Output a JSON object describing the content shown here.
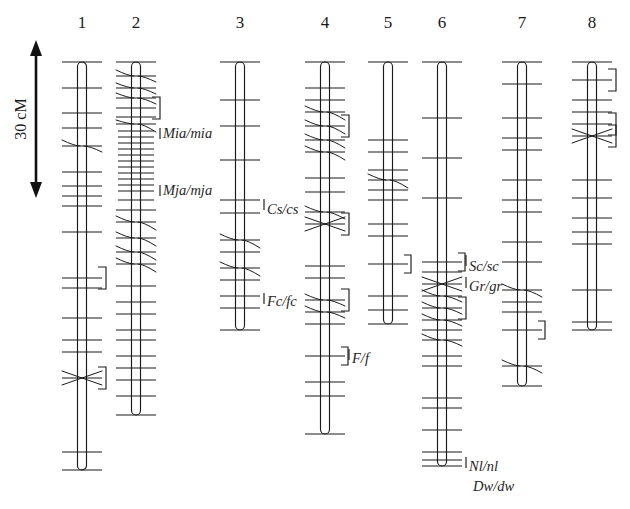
{
  "figure": {
    "width": 630,
    "height": 509,
    "background": "#ffffff",
    "line_color": "#1a1a1a"
  },
  "scale": {
    "label": "30 cM",
    "value": 30,
    "unit": "cM",
    "x": 36,
    "y_top": 42,
    "y_bottom": 196,
    "pixels_per_cM": 5.133
  },
  "chart_data": {
    "type": "linkage-map",
    "xlabel": "",
    "ylabel": "30 cM",
    "axis_unit": "cM",
    "legend_position": "none",
    "grid": false,
    "group_label_y": 28,
    "linkage_groups": [
      {
        "name": "1",
        "x": 82,
        "top": 62,
        "bottom": 470,
        "markers": [
          {
            "y": 62,
            "style": "plain"
          },
          {
            "y": 88,
            "style": "plain"
          },
          {
            "y": 113,
            "style": "plain"
          },
          {
            "y": 128,
            "style": "plain"
          },
          {
            "y": 146,
            "style": "fan",
            "fan": [
              140,
              152
            ]
          },
          {
            "y": 172,
            "style": "plain"
          },
          {
            "y": 186,
            "style": "plain"
          },
          {
            "y": 196,
            "style": "plain"
          },
          {
            "y": 206,
            "style": "plain"
          },
          {
            "y": 232,
            "style": "plain"
          },
          {
            "y": 278,
            "style": "plain",
            "bracket": true
          },
          {
            "y": 288,
            "style": "plain"
          },
          {
            "y": 318,
            "style": "plain"
          },
          {
            "y": 340,
            "style": "plain"
          },
          {
            "y": 352,
            "style": "plain"
          },
          {
            "y": 378,
            "style": "cross",
            "bracket": true
          },
          {
            "y": 452,
            "style": "plain"
          },
          {
            "y": 470,
            "style": "plain"
          }
        ]
      },
      {
        "name": "2",
        "x": 136,
        "top": 62,
        "bottom": 415,
        "markers": [
          {
            "y": 62,
            "style": "plain"
          },
          {
            "y": 76,
            "style": "fan",
            "fan": [
              70,
              82
            ]
          },
          {
            "y": 88,
            "style": "fan",
            "fan": [
              83,
              94
            ]
          },
          {
            "y": 98,
            "style": "fan",
            "fan": [
              93,
              104
            ]
          },
          {
            "y": 108,
            "style": "plain",
            "bracket": true
          },
          {
            "y": 117,
            "style": "plain"
          },
          {
            "y": 124,
            "style": "fan",
            "fan": [
              120,
              132
            ]
          },
          {
            "y": 131,
            "style": "dense"
          },
          {
            "y": 137,
            "style": "dense"
          },
          {
            "y": 143,
            "style": "dense"
          },
          {
            "y": 149,
            "style": "dense"
          },
          {
            "y": 155,
            "style": "dense"
          },
          {
            "y": 161,
            "style": "dense"
          },
          {
            "y": 167,
            "style": "dense"
          },
          {
            "y": 173,
            "style": "dense"
          },
          {
            "y": 179,
            "style": "dense"
          },
          {
            "y": 185,
            "style": "dense"
          },
          {
            "y": 191,
            "style": "dense"
          },
          {
            "y": 200,
            "style": "dense"
          },
          {
            "y": 210,
            "style": "plain"
          },
          {
            "y": 222,
            "style": "fan",
            "fan": [
              216,
              230
            ]
          },
          {
            "y": 238,
            "style": "fan",
            "fan": [
              232,
              246
            ]
          },
          {
            "y": 252,
            "style": "fan",
            "fan": [
              246,
              260
            ]
          },
          {
            "y": 264,
            "style": "fan",
            "fan": [
              258,
              272
            ]
          },
          {
            "y": 286,
            "style": "plain"
          },
          {
            "y": 302,
            "style": "plain"
          },
          {
            "y": 314,
            "style": "plain"
          },
          {
            "y": 330,
            "style": "plain"
          },
          {
            "y": 340,
            "style": "plain"
          },
          {
            "y": 356,
            "style": "plain"
          },
          {
            "y": 368,
            "style": "plain"
          },
          {
            "y": 380,
            "style": "plain"
          },
          {
            "y": 396,
            "style": "plain"
          },
          {
            "y": 415,
            "style": "plain"
          }
        ],
        "loci": [
          {
            "label": "Mia/mia",
            "y": 135,
            "anchor_y": 135
          },
          {
            "label": "Mja/mja",
            "y": 192,
            "anchor_y": 192
          }
        ]
      },
      {
        "name": "3",
        "x": 240,
        "top": 62,
        "bottom": 330,
        "markers": [
          {
            "y": 62,
            "style": "plain"
          },
          {
            "y": 100,
            "style": "plain"
          },
          {
            "y": 126,
            "style": "plain"
          },
          {
            "y": 160,
            "style": "plain"
          },
          {
            "y": 200,
            "style": "plain"
          },
          {
            "y": 213,
            "style": "plain"
          },
          {
            "y": 240,
            "style": "fan",
            "fan": [
              234,
              248
            ]
          },
          {
            "y": 252,
            "style": "plain"
          },
          {
            "y": 268,
            "style": "fan",
            "fan": [
              262,
              276
            ]
          },
          {
            "y": 280,
            "style": "plain"
          },
          {
            "y": 296,
            "style": "plain"
          },
          {
            "y": 308,
            "style": "plain"
          },
          {
            "y": 330,
            "style": "plain"
          }
        ],
        "loci": [
          {
            "label": "Cs/cs",
            "y": 211,
            "anchor_y": 206
          },
          {
            "label": "Fc/fc",
            "y": 303,
            "anchor_y": 300
          }
        ]
      },
      {
        "name": "4",
        "x": 325,
        "top": 62,
        "bottom": 434,
        "markers": [
          {
            "y": 62,
            "style": "plain"
          },
          {
            "y": 88,
            "style": "plain"
          },
          {
            "y": 100,
            "style": "plain"
          },
          {
            "y": 112,
            "style": "fan",
            "fan": [
              106,
              120
            ]
          },
          {
            "y": 126,
            "style": "fan",
            "fan": [
              120,
              134
            ],
            "bracket": true
          },
          {
            "y": 140,
            "style": "fan",
            "fan": [
              134,
              148
            ]
          },
          {
            "y": 152,
            "style": "fan",
            "fan": [
              146,
              160
            ]
          },
          {
            "y": 178,
            "style": "plain"
          },
          {
            "y": 192,
            "style": "plain"
          },
          {
            "y": 212,
            "style": "fan",
            "fan": [
              206,
              219
            ]
          },
          {
            "y": 224,
            "style": "cross",
            "bracket": true
          },
          {
            "y": 266,
            "style": "plain"
          },
          {
            "y": 278,
            "style": "plain"
          },
          {
            "y": 300,
            "style": "fan",
            "fan": [
              294,
              306
            ],
            "bracket": true
          },
          {
            "y": 312,
            "style": "fan",
            "fan": [
              306,
              318
            ]
          },
          {
            "y": 324,
            "style": "plain"
          },
          {
            "y": 356,
            "style": "plain",
            "bracket_small": true
          },
          {
            "y": 382,
            "style": "plain"
          },
          {
            "y": 396,
            "style": "plain"
          },
          {
            "y": 434,
            "style": "plain"
          }
        ],
        "loci": [
          {
            "label": "F/f",
            "y": 360,
            "anchor_y": 356
          }
        ]
      },
      {
        "name": "5",
        "x": 388,
        "top": 62,
        "bottom": 324,
        "markers": [
          {
            "y": 62,
            "style": "plain"
          },
          {
            "y": 140,
            "style": "plain"
          },
          {
            "y": 152,
            "style": "plain"
          },
          {
            "y": 170,
            "style": "plain"
          },
          {
            "y": 180,
            "style": "fan",
            "fan": [
              174,
              188
            ]
          },
          {
            "y": 190,
            "style": "plain"
          },
          {
            "y": 200,
            "style": "plain"
          },
          {
            "y": 224,
            "style": "plain"
          },
          {
            "y": 236,
            "style": "plain"
          },
          {
            "y": 264,
            "style": "plain",
            "bracket_small": true
          },
          {
            "y": 296,
            "style": "plain"
          },
          {
            "y": 310,
            "style": "plain"
          },
          {
            "y": 324,
            "style": "plain"
          }
        ]
      },
      {
        "name": "6",
        "x": 442,
        "top": 62,
        "bottom": 466,
        "markers": [
          {
            "y": 62,
            "style": "plain"
          },
          {
            "y": 118,
            "style": "plain"
          },
          {
            "y": 158,
            "style": "plain"
          },
          {
            "y": 198,
            "style": "plain"
          },
          {
            "y": 262,
            "style": "plain",
            "bracket_small": true
          },
          {
            "y": 272,
            "style": "plain"
          },
          {
            "y": 284,
            "style": "cross"
          },
          {
            "y": 296,
            "style": "fan",
            "fan": [
              290,
              302
            ]
          },
          {
            "y": 308,
            "style": "fan",
            "fan": [
              302,
              314
            ],
            "bracket": true
          },
          {
            "y": 320,
            "style": "fan",
            "fan": [
              314,
              326
            ]
          },
          {
            "y": 330,
            "style": "plain"
          },
          {
            "y": 340,
            "style": "fan",
            "fan": [
              334,
              346
            ]
          },
          {
            "y": 356,
            "style": "plain"
          },
          {
            "y": 366,
            "style": "plain"
          },
          {
            "y": 398,
            "style": "plain"
          },
          {
            "y": 408,
            "style": "plain"
          },
          {
            "y": 430,
            "style": "plain"
          },
          {
            "y": 452,
            "style": "plain"
          },
          {
            "y": 460,
            "style": "plain"
          },
          {
            "y": 466,
            "style": "plain"
          }
        ],
        "loci": [
          {
            "label": "Sc/sc",
            "y": 268,
            "anchor_y": 262
          },
          {
            "label": "Gr/gr",
            "y": 288,
            "anchor_y": 284
          },
          {
            "label": "Nl/nl",
            "y": 468,
            "anchor_y": 464
          },
          {
            "label": "Dw/dw",
            "y": 488,
            "anchor_y": 488,
            "no_leader": true
          }
        ]
      },
      {
        "name": "7",
        "x": 522,
        "top": 62,
        "bottom": 386,
        "markers": [
          {
            "y": 62,
            "style": "plain"
          },
          {
            "y": 84,
            "style": "plain"
          },
          {
            "y": 118,
            "style": "plain"
          },
          {
            "y": 138,
            "style": "plain"
          },
          {
            "y": 150,
            "style": "plain"
          },
          {
            "y": 180,
            "style": "plain"
          },
          {
            "y": 200,
            "style": "plain"
          },
          {
            "y": 212,
            "style": "plain"
          },
          {
            "y": 242,
            "style": "plain"
          },
          {
            "y": 262,
            "style": "plain"
          },
          {
            "y": 290,
            "style": "fan",
            "fan": [
              284,
              297
            ]
          },
          {
            "y": 302,
            "style": "plain"
          },
          {
            "y": 312,
            "style": "plain"
          },
          {
            "y": 330,
            "style": "plain",
            "bracket_small": true
          },
          {
            "y": 366,
            "style": "fan",
            "fan": [
              360,
              373
            ]
          },
          {
            "y": 386,
            "style": "plain"
          }
        ]
      },
      {
        "name": "8",
        "x": 592,
        "top": 62,
        "bottom": 330,
        "markers": [
          {
            "y": 62,
            "style": "plain"
          },
          {
            "y": 80,
            "style": "plain",
            "bracket": true
          },
          {
            "y": 100,
            "style": "plain"
          },
          {
            "y": 112,
            "style": "plain"
          },
          {
            "y": 124,
            "style": "plain",
            "bracket": true
          },
          {
            "y": 136,
            "style": "cross",
            "bracket": true
          },
          {
            "y": 180,
            "style": "plain"
          },
          {
            "y": 198,
            "style": "plain"
          },
          {
            "y": 218,
            "style": "plain"
          },
          {
            "y": 232,
            "style": "plain"
          },
          {
            "y": 244,
            "style": "plain"
          },
          {
            "y": 290,
            "style": "plain"
          },
          {
            "y": 322,
            "style": "plain"
          },
          {
            "y": 330,
            "style": "plain"
          }
        ]
      }
    ]
  }
}
